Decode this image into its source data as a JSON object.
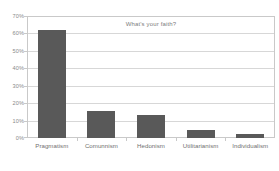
{
  "chart_data": {
    "type": "bar",
    "title": "What's your faith?",
    "xlabel": "",
    "ylabel": "",
    "categories": [
      "Pragmatism",
      "Comunnism",
      "Hedonism",
      "Utilitarianism",
      "Individualism"
    ],
    "values": [
      62,
      15.5,
      13,
      4.5,
      2.5
    ],
    "ytick_labels": [
      "0%",
      "10%",
      "20%",
      "30%",
      "40%",
      "50%",
      "60%",
      "70%"
    ],
    "ytick_values": [
      0,
      10,
      20,
      30,
      40,
      50,
      60,
      70
    ],
    "ylim": [
      0,
      70
    ],
    "grid": true,
    "legend": false,
    "bar_color": "#595959",
    "grid_color": "#d7d7d7",
    "frame_color": "#c9c9c9",
    "text_color": "#808080",
    "background": "#ffffff"
  }
}
